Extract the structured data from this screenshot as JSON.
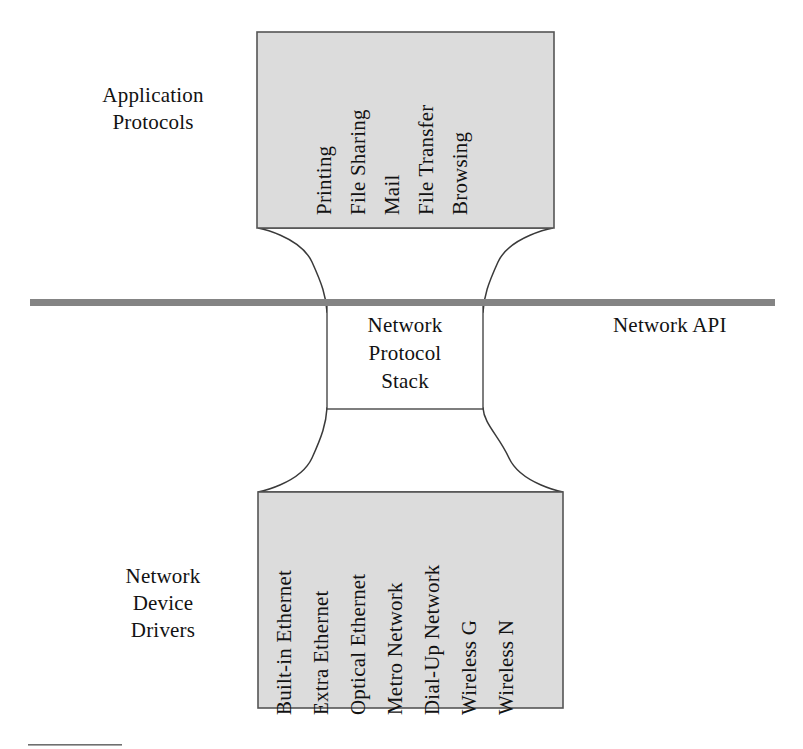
{
  "diagram": {
    "title_semantics": "network-stack-hourglass",
    "colors": {
      "box_fill": "#dcdcdc",
      "box_stroke": "#555555",
      "neck_fill": "#ffffff",
      "api_bar": "#848484",
      "text": "#121212"
    },
    "application_protocols": {
      "label": "Application\nProtocols",
      "items": [
        "Printing",
        "File Sharing",
        "Mail",
        "File Transfer",
        "Browsing"
      ]
    },
    "neck": {
      "label": "Network\nProtocol\nStack"
    },
    "api_boundary": {
      "label": "Network API"
    },
    "network_device_drivers": {
      "label": "Network\nDevice\nDrivers",
      "items": [
        "Built-in Ethernet",
        "Extra Ethernet",
        "Optical Ethernet",
        "Metro Network",
        "Dial-Up Network",
        "Wireless G",
        "Wireless N"
      ]
    }
  }
}
